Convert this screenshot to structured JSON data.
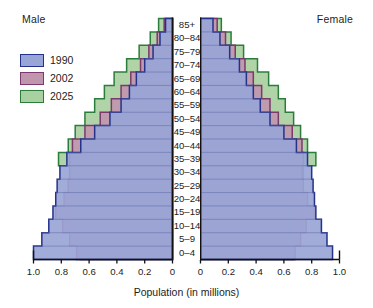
{
  "titles": {
    "male": "Male",
    "female": "Female"
  },
  "legend": {
    "items": [
      {
        "label": "1990",
        "fill": "#99a5d6",
        "stroke": "#24328c",
        "name": "legend-item-1990"
      },
      {
        "label": "2002",
        "fill": "#c096ae",
        "stroke": "#7b3a6b",
        "name": "legend-item-2002"
      },
      {
        "label": "2025",
        "fill": "#a9d0a1",
        "stroke": "#2b7d3c",
        "name": "legend-item-2025"
      }
    ]
  },
  "axis": {
    "caption": "Population (in millions)",
    "left_ticks": [
      "1.0",
      "0.8",
      "0.6",
      "0.4",
      "0.2",
      "0"
    ],
    "right_ticks": [
      "0",
      "0.2",
      "0.4",
      "0.6",
      "0.8",
      "1.0"
    ]
  },
  "chart_data": {
    "type": "bar",
    "subtype": "population-pyramid",
    "title": "",
    "xlabel": "Population (in millions)",
    "ylabel": "",
    "xlim": [
      0,
      1.0
    ],
    "xticks": [
      0,
      0.2,
      0.4,
      0.6,
      0.8,
      1.0
    ],
    "grid": false,
    "legend_position": "top-left",
    "categories": [
      "85+",
      "80–84",
      "75–79",
      "70–74",
      "65–69",
      "60–64",
      "55–59",
      "50–54",
      "45–49",
      "40–44",
      "35–39",
      "30–34",
      "25–29",
      "20–24",
      "15–19",
      "10–14",
      "5–9",
      "0–4"
    ],
    "series": [
      {
        "name": "1990",
        "fill": "#99a5d6",
        "stroke": "#24328c",
        "male": [
          0.05,
          0.09,
          0.14,
          0.2,
          0.26,
          0.31,
          0.37,
          0.45,
          0.56,
          0.66,
          0.76,
          0.81,
          0.83,
          0.84,
          0.86,
          0.89,
          0.94,
          1.0
        ],
        "female": [
          0.09,
          0.14,
          0.21,
          0.28,
          0.33,
          0.38,
          0.43,
          0.5,
          0.6,
          0.69,
          0.77,
          0.8,
          0.81,
          0.82,
          0.83,
          0.87,
          0.91,
          0.95
        ]
      },
      {
        "name": "2002",
        "fill": "#c096ae",
        "stroke": "#7b3a6b",
        "male": [
          0.06,
          0.11,
          0.17,
          0.23,
          0.3,
          0.37,
          0.44,
          0.52,
          0.63,
          0.72,
          0.74,
          0.74,
          0.75,
          0.78,
          0.84,
          0.79,
          0.74,
          0.69
        ],
        "female": [
          0.12,
          0.18,
          0.25,
          0.32,
          0.38,
          0.44,
          0.5,
          0.56,
          0.66,
          0.73,
          0.74,
          0.73,
          0.74,
          0.77,
          0.82,
          0.76,
          0.72,
          0.68
        ]
      },
      {
        "name": "2025",
        "fill": "#a9d0a1",
        "stroke": "#2b7d3c",
        "male": [
          0.1,
          0.16,
          0.24,
          0.33,
          0.42,
          0.49,
          0.56,
          0.63,
          0.7,
          0.75,
          0.82,
          0.74,
          0.72,
          0.71,
          0.7,
          0.69,
          0.68,
          0.66
        ],
        "female": [
          0.15,
          0.22,
          0.31,
          0.41,
          0.49,
          0.56,
          0.61,
          0.67,
          0.72,
          0.77,
          0.83,
          0.74,
          0.73,
          0.72,
          0.71,
          0.7,
          0.69,
          0.67
        ]
      }
    ]
  }
}
